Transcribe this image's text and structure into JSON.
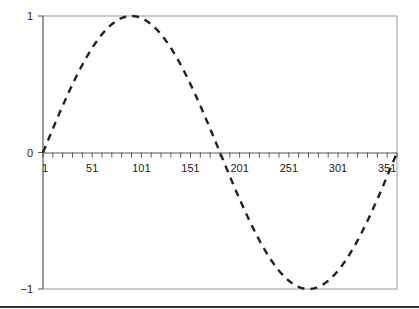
{
  "chart_data": {
    "type": "line",
    "title": "",
    "xlabel": "",
    "ylabel": "",
    "series": [
      {
        "name": "sin(x)",
        "style": "dashed",
        "color": "#222222",
        "x_start": 1,
        "x_end": 361,
        "x_step": 10,
        "function": "sin((x-1) degrees)",
        "x": [
          1,
          11,
          21,
          31,
          41,
          51,
          61,
          71,
          81,
          91,
          101,
          111,
          121,
          131,
          141,
          151,
          161,
          171,
          181,
          191,
          201,
          211,
          221,
          231,
          241,
          251,
          261,
          271,
          281,
          291,
          301,
          311,
          321,
          331,
          341,
          351,
          361
        ],
        "values": [
          0,
          0.17,
          0.34,
          0.5,
          0.64,
          0.77,
          0.87,
          0.94,
          0.98,
          1.0,
          0.98,
          0.94,
          0.87,
          0.77,
          0.64,
          0.5,
          0.34,
          0.17,
          0,
          -0.17,
          -0.34,
          -0.5,
          -0.64,
          -0.77,
          -0.87,
          -0.94,
          -0.98,
          -1.0,
          -0.98,
          -0.94,
          -0.87,
          -0.77,
          -0.64,
          -0.5,
          -0.34,
          -0.17,
          0
        ]
      }
    ],
    "x_tick_labels": [
      "1",
      "51",
      "101",
      "151",
      "201",
      "251",
      "301",
      "351"
    ],
    "y_tick_labels": [
      "1",
      "0",
      "−1"
    ],
    "xlim": [
      1,
      361
    ],
    "ylim": [
      -1,
      1
    ],
    "grid": false,
    "legend": "none"
  }
}
